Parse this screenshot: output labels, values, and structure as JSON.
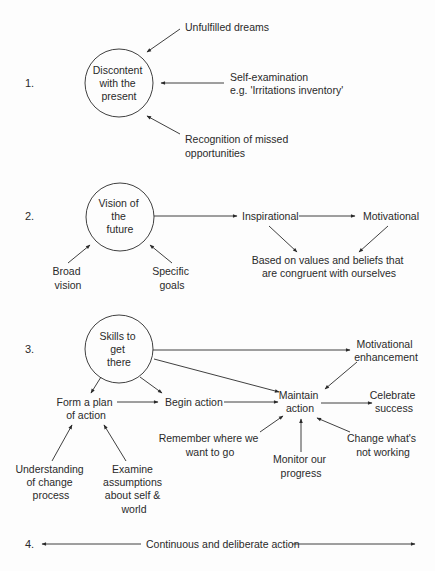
{
  "stages": {
    "s1": {
      "number": "1.",
      "circle": [
        "Discontent",
        "with the",
        "present"
      ],
      "inputs": {
        "a": [
          "Unfulfilled dreams"
        ],
        "b": [
          "Self-examination",
          "e.g. 'Irritations inventory'"
        ],
        "c": [
          "Recognition of missed",
          "opportunities"
        ]
      }
    },
    "s2": {
      "number": "2.",
      "circle": [
        "Vision of",
        "the",
        "future"
      ],
      "broad": [
        "Broad",
        "vision"
      ],
      "specific": [
        "Specific",
        "goals"
      ],
      "inspirational": "Inspirational",
      "motivational": "Motivational",
      "based": [
        "Based on values and beliefs that",
        "are congruent with ourselves"
      ]
    },
    "s3": {
      "number": "3.",
      "circle": [
        "Skills to",
        "get",
        "there"
      ],
      "motivational_enhancement": [
        "Motivational",
        "enhancement"
      ],
      "form_plan": [
        "Form a plan",
        "of action"
      ],
      "begin_action": "Begin action",
      "maintain_action": [
        "Maintain",
        "action"
      ],
      "celebrate": [
        "Celebrate",
        "success"
      ],
      "remember": [
        "Remember where we",
        "want to go"
      ],
      "monitor": [
        "Monitor our",
        "progress"
      ],
      "change": [
        "Change what's",
        "not working"
      ],
      "understanding": [
        "Understanding",
        "of change",
        "process"
      ],
      "examine": [
        "Examine",
        "assumptions",
        "about self &",
        "world"
      ]
    },
    "s4": {
      "number": "4.",
      "label": "Continuous and deliberate action"
    }
  }
}
